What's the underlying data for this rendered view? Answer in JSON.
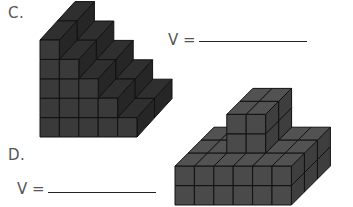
{
  "problems": [
    {
      "label": "C.",
      "answer_prefix": "V =",
      "answer_value": "",
      "figure": {
        "type": "staircase",
        "column_heights": [
          5,
          4,
          3,
          2,
          1
        ],
        "depth": 2
      }
    },
    {
      "label": "D.",
      "answer_prefix": "V =",
      "answer_value": "",
      "figure": {
        "type": "base-with-tower",
        "base": {
          "width": 6,
          "depth": 3,
          "height": 2
        },
        "tower": {
          "width": 2,
          "depth": 2,
          "height": 2
        }
      }
    }
  ],
  "colors": {
    "cube_front": "#3a3a3a",
    "cube_top": "#2f2f2f",
    "cube_side": "#262626",
    "cube_front_d": "#4a4a4a",
    "cube_top_d": "#525252",
    "cube_side_d": "#3e3e3e",
    "edge": "#111111"
  }
}
